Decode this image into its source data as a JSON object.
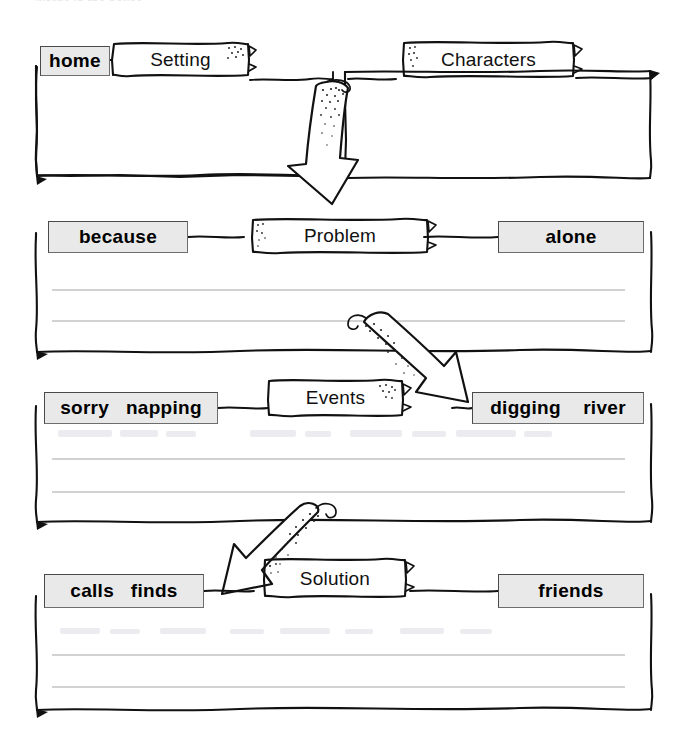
{
  "worksheet": {
    "type": "story-map-graphic-organizer",
    "cut_off_instruction": "words in the boxes",
    "ink_color": "#111111",
    "chip_fill": "#e9e9e9",
    "chip_border": "#4a4a4a",
    "rule_color": "#c3c3c3",
    "paper_color": "#ffffff"
  },
  "sections": [
    {
      "id": "setting-characters",
      "titles": [
        "Setting",
        "Characters"
      ],
      "word_bank": [
        "home"
      ],
      "rule_lines": 0
    },
    {
      "id": "problem",
      "titles": [
        "Problem"
      ],
      "word_bank": [
        "because",
        "alone"
      ],
      "rule_lines": 2
    },
    {
      "id": "events",
      "titles": [
        "Events"
      ],
      "word_bank": [
        "sorry   napping",
        "digging    river"
      ],
      "rule_lines": 2
    },
    {
      "id": "solution",
      "titles": [
        "Solution"
      ],
      "word_bank": [
        "calls   finds",
        "friends"
      ],
      "rule_lines": 2
    }
  ],
  "labels": {
    "home": "home",
    "setting": "Setting",
    "characters": "Characters",
    "because": "because",
    "problem": "Problem",
    "alone": "alone",
    "sorry_napping": "sorry   napping",
    "events": "Events",
    "digging_river": "digging    river",
    "calls_finds": "calls   finds",
    "solution": "Solution",
    "friends": "friends"
  },
  "arrows": [
    {
      "name": "arrow-setting-to-problem",
      "direction": "down"
    },
    {
      "name": "arrow-problem-to-events",
      "direction": "down-right"
    },
    {
      "name": "arrow-events-to-solution",
      "direction": "down-left"
    }
  ]
}
